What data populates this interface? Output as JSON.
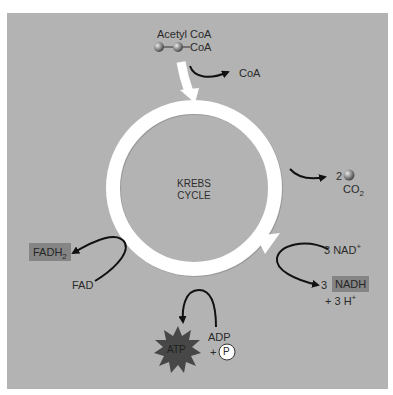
{
  "figure": {
    "background_color": "#b3b3b3",
    "ring_color": "#ffffff",
    "highlight_box_color": "#858585",
    "arrow_color": "#111111"
  },
  "center": {
    "line1": "KREBS",
    "line2": "CYCLE"
  },
  "input": {
    "title": "Acetyl CoA",
    "molecule_suffix": "CoA",
    "released": "CoA"
  },
  "co2": {
    "count": "2",
    "label": "CO",
    "subscript": "2"
  },
  "nad": {
    "reactant": "3 NAD",
    "reactant_sup": "+",
    "product_count": "3",
    "product": "NADH",
    "proton": "+ 3 H",
    "proton_sup": "+"
  },
  "fad": {
    "reactant": "FAD",
    "product": "FADH",
    "product_sub": "2"
  },
  "atp": {
    "product": "ATP",
    "reactant": "ADP",
    "plus": "+",
    "phosphate": "P"
  }
}
